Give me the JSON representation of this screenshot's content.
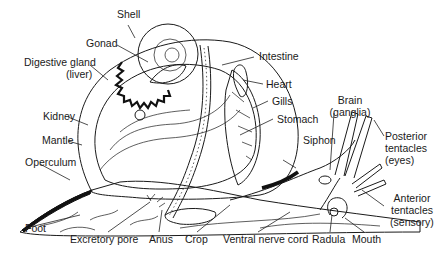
{
  "diagram": {
    "colors": {
      "ink": "#1a1a1a",
      "background": "#ffffff",
      "stipple": "#555555"
    },
    "labels": {
      "shell": "Shell",
      "gonad": "Gonad",
      "digestive_gland": "Digestive gland",
      "digestive_gland_sub": "(liver)",
      "kidney": "Kidney",
      "mantle": "Mantle",
      "operculum": "Operculum",
      "foot": "Foot",
      "excretory_pore": "Excretory pore",
      "anus": "Anus",
      "crop": "Crop",
      "ventral_nerve_cord": "Ventral nerve cord",
      "radula": "Radula",
      "mouth": "Mouth",
      "intestine": "Intestine",
      "heart": "Heart",
      "gills": "Gills",
      "stomach": "Stomach",
      "siphon": "Siphon",
      "brain": "Brain",
      "brain_sub": "(ganglia)",
      "posterior_tentacles": "Posterior",
      "posterior_tentacles_2": "tentacles",
      "posterior_tentacles_sub": "(eyes)",
      "anterior_tentacles": "Anterior",
      "anterior_tentacles_2": "tentacles",
      "anterior_tentacles_sub": "(sensory)"
    }
  }
}
